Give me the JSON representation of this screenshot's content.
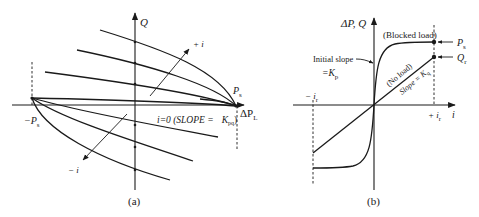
{
  "figure": {
    "panel_a": {
      "caption": "(a)",
      "y_axis_label": "Q",
      "x_axis_label_main": "ΔP",
      "x_axis_label_sub": "L",
      "right_point_label_main": "P",
      "right_point_label_sub": "s",
      "left_point_label_main": "−P",
      "left_point_label_sub": "s",
      "increasing_current_label": "+ i",
      "decreasing_current_label": "− i",
      "zero_current_label": "i=0 (SLOPE =",
      "zero_current_slope_main": "K",
      "zero_current_slope_sub": "pq",
      "zero_current_close": ")"
    },
    "panel_b": {
      "caption": "(b)",
      "y_axis_label": "ΔP, Q",
      "x_axis_label": "i",
      "blocked_load_label": "(Blocked load)",
      "no_load_label": "(No load)",
      "slope_label_main": "Slope = K",
      "slope_label_sub": "q",
      "initial_slope_line1": "Initial slope",
      "initial_slope_line2_main": "=K",
      "initial_slope_line2_sub": "p",
      "ps_label_main": "P",
      "ps_label_sub": "s",
      "qr_label_main": "Q",
      "qr_label_sub": "r",
      "neg_current_label_main": "− i",
      "neg_current_label_sub": "r",
      "pos_current_label_main": "+ i",
      "pos_current_label_sub": "r"
    }
  }
}
